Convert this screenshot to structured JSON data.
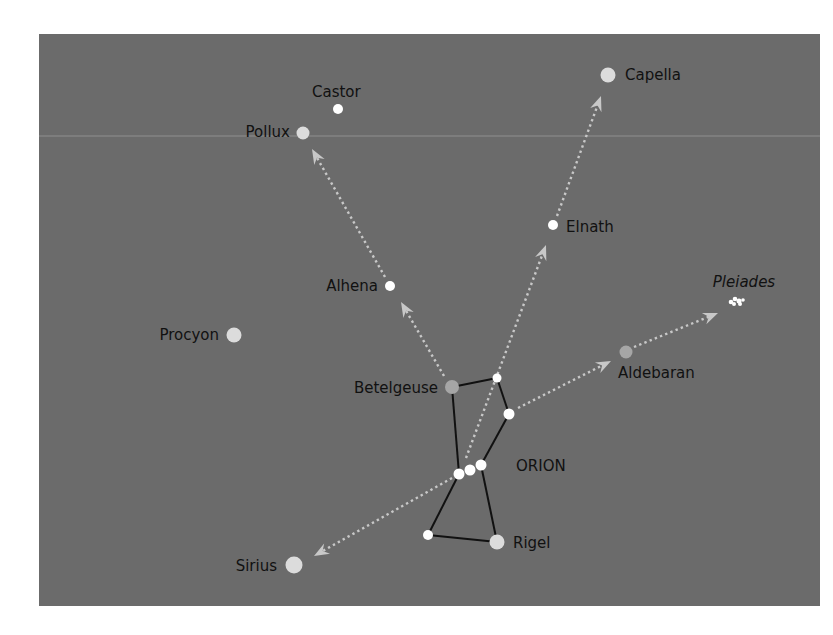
{
  "colors": {
    "background": "#ffffff",
    "panel": "#6b6b6b",
    "guide_line": "#c8c8c8",
    "constellation_line": "#111111",
    "star_white": "#ffffff",
    "star_light": "#dcdcdc",
    "star_gray": "#a6a6a6",
    "label": "#111111",
    "faint_rule": "#a9a9a9"
  },
  "panel": {
    "x": 39,
    "y": 34,
    "width": 781,
    "height": 572
  },
  "constellation": {
    "name": "ORION",
    "label_pos": {
      "x": 516,
      "y": 471
    },
    "lines": [
      [
        [
          452,
          387
        ],
        [
          497,
          378
        ]
      ],
      [
        [
          497,
          378
        ],
        [
          509,
          414
        ]
      ],
      [
        [
          509,
          414
        ],
        [
          481,
          465
        ]
      ],
      [
        [
          452,
          387
        ],
        [
          459,
          474
        ]
      ],
      [
        [
          459,
          474
        ],
        [
          428,
          535
        ]
      ],
      [
        [
          481,
          465
        ],
        [
          497,
          542
        ]
      ],
      [
        [
          428,
          535
        ],
        [
          497,
          542
        ]
      ]
    ],
    "stars": [
      {
        "name": "Betelgeuse",
        "x": 452,
        "y": 387,
        "r": 7,
        "tone": "gray"
      },
      {
        "name": "Bellatrix",
        "x": 497,
        "y": 378,
        "r": 4.5,
        "tone": "white"
      },
      {
        "name": "Orion-star-3",
        "x": 509,
        "y": 414,
        "r": 5.5,
        "tone": "white"
      },
      {
        "name": "Alnitak",
        "x": 459,
        "y": 474,
        "r": 5.5,
        "tone": "white"
      },
      {
        "name": "Alnilam",
        "x": 470,
        "y": 470,
        "r": 5.5,
        "tone": "white"
      },
      {
        "name": "Mintaka",
        "x": 481,
        "y": 465,
        "r": 5.5,
        "tone": "white"
      },
      {
        "name": "Saiph",
        "x": 428,
        "y": 535,
        "r": 5,
        "tone": "white"
      },
      {
        "name": "Rigel",
        "x": 497,
        "y": 542,
        "r": 7.5,
        "tone": "light"
      }
    ]
  },
  "stars": [
    {
      "name": "Castor",
      "x": 338,
      "y": 109,
      "r": 5,
      "tone": "white",
      "label": "Castor",
      "lx": 312,
      "ly": 97,
      "anchor": "start"
    },
    {
      "name": "Pollux",
      "x": 303,
      "y": 133,
      "r": 6.5,
      "tone": "light",
      "label": "Pollux",
      "lx": 290,
      "ly": 137,
      "anchor": "end"
    },
    {
      "name": "Capella",
      "x": 608,
      "y": 75,
      "r": 7.5,
      "tone": "light",
      "label": "Capella",
      "lx": 625,
      "ly": 80,
      "anchor": "start"
    },
    {
      "name": "Elnath",
      "x": 553,
      "y": 225,
      "r": 5,
      "tone": "white",
      "label": "Elnath",
      "lx": 566,
      "ly": 232,
      "anchor": "start"
    },
    {
      "name": "Alhena",
      "x": 390,
      "y": 286,
      "r": 5,
      "tone": "white",
      "label": "Alhena",
      "lx": 378,
      "ly": 291,
      "anchor": "end"
    },
    {
      "name": "Procyon",
      "x": 234,
      "y": 335,
      "r": 7.5,
      "tone": "light",
      "label": "Procyon",
      "lx": 219,
      "ly": 340,
      "anchor": "end"
    },
    {
      "name": "Aldebaran",
      "x": 626,
      "y": 352,
      "r": 6.5,
      "tone": "gray",
      "label": "Aldebaran",
      "lx": 618,
      "ly": 378,
      "anchor": "start"
    },
    {
      "name": "Sirius",
      "x": 294,
      "y": 565,
      "r": 8.5,
      "tone": "light",
      "label": "Sirius",
      "lx": 277,
      "ly": 571,
      "anchor": "end"
    }
  ],
  "labels": [
    {
      "id": "betelgeuse",
      "text": "Betelgeuse",
      "x": 438,
      "y": 393,
      "anchor": "end",
      "italic": false
    },
    {
      "id": "rigel",
      "text": "Rigel",
      "x": 513,
      "y": 548,
      "anchor": "start",
      "italic": false
    },
    {
      "id": "pleiades",
      "text": "Pleiades",
      "x": 744,
      "y": 287,
      "anchor": "middle",
      "italic": true
    }
  ],
  "pleiades": {
    "name": "Pleiades",
    "dots": [
      {
        "x": 731,
        "y": 302,
        "r": 2.3
      },
      {
        "x": 735,
        "y": 299,
        "r": 2.3
      },
      {
        "x": 739,
        "y": 301,
        "r": 2.5
      },
      {
        "x": 734,
        "y": 304,
        "r": 2
      },
      {
        "x": 740,
        "y": 304,
        "r": 2
      },
      {
        "x": 743,
        "y": 300,
        "r": 1.8
      }
    ]
  },
  "guides": [
    {
      "from": "Betelgeuse",
      "to": "Alhena",
      "x1": 444,
      "y1": 376,
      "x2": 401,
      "y2": 302
    },
    {
      "from": "Alhena",
      "to": "Pollux",
      "x1": 385,
      "y1": 277,
      "x2": 312,
      "y2": 149
    },
    {
      "from": "Orion belt",
      "to": "Elnath",
      "x1": 466,
      "y1": 458,
      "x2": 546,
      "y2": 245
    },
    {
      "from": "Elnath",
      "to": "Capella",
      "x1": 557,
      "y1": 216,
      "x2": 601,
      "y2": 96
    },
    {
      "from": "Orion",
      "to": "Aldebaran",
      "x1": 518,
      "y1": 408,
      "x2": 611,
      "y2": 361
    },
    {
      "from": "Aldebaran",
      "to": "Pleiades",
      "x1": 634,
      "y1": 347,
      "x2": 718,
      "y2": 313
    },
    {
      "from": "Orion belt",
      "to": "Sirius",
      "x1": 452,
      "y1": 478,
      "x2": 314,
      "y2": 556
    }
  ],
  "faint_rule": {
    "y": 136
  }
}
